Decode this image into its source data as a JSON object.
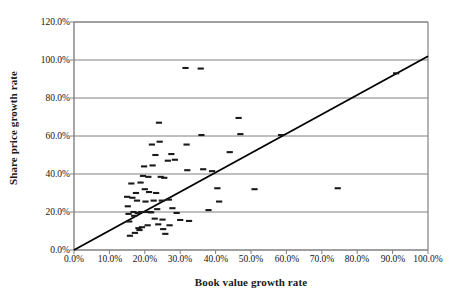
{
  "chart_data": {
    "type": "scatter",
    "title": "",
    "xlabel": "Book value growth rate",
    "ylabel": "Share price growth rate",
    "xlim": [
      0,
      100
    ],
    "ylim": [
      0,
      120
    ],
    "xticks": [
      "0.0%",
      "10.0%",
      "20.0%",
      "30.0%",
      "40.0%",
      "50.0%",
      "60.0%",
      "70.0%",
      "80.0%",
      "90.0%",
      "100.0%"
    ],
    "xtick_values": [
      0,
      10,
      20,
      30,
      40,
      50,
      60,
      70,
      80,
      90,
      100
    ],
    "yticks": [
      "0.0%",
      "20.0%",
      "40.0%",
      "60.0%",
      "80.0%",
      "100.0%",
      "120.0%"
    ],
    "ytick_values": [
      0,
      20,
      40,
      60,
      80,
      100,
      120
    ],
    "grid": "horizontal",
    "legend": "none",
    "marker": "horizontal-dash",
    "marker_color": "#1a1a1a",
    "trendline": {
      "label": "",
      "color": "#000000",
      "x_start": 0.0,
      "y_start": 0.0,
      "x_end": 100.0,
      "y_end": 102.0
    },
    "points": [
      {
        "x": 15.0,
        "y": 28.0
      },
      {
        "x": 15.2,
        "y": 23.0
      },
      {
        "x": 15.4,
        "y": 19.0
      },
      {
        "x": 15.6,
        "y": 15.0
      },
      {
        "x": 15.8,
        "y": 7.5
      },
      {
        "x": 16.2,
        "y": 35.0
      },
      {
        "x": 16.5,
        "y": 27.5
      },
      {
        "x": 16.8,
        "y": 20.0
      },
      {
        "x": 17.0,
        "y": 18.0
      },
      {
        "x": 17.2,
        "y": 9.0
      },
      {
        "x": 17.5,
        "y": 30.0
      },
      {
        "x": 17.8,
        "y": 26.0
      },
      {
        "x": 18.0,
        "y": 19.5
      },
      {
        "x": 18.2,
        "y": 11.5
      },
      {
        "x": 18.5,
        "y": 10.5
      },
      {
        "x": 18.8,
        "y": 35.5
      },
      {
        "x": 19.0,
        "y": 20.0
      },
      {
        "x": 19.2,
        "y": 12.0
      },
      {
        "x": 19.5,
        "y": 39.0
      },
      {
        "x": 19.8,
        "y": 44.0
      },
      {
        "x": 20.0,
        "y": 32.0
      },
      {
        "x": 20.2,
        "y": 25.5
      },
      {
        "x": 20.5,
        "y": 20.0
      },
      {
        "x": 20.8,
        "y": 13.0
      },
      {
        "x": 21.0,
        "y": 38.5
      },
      {
        "x": 21.2,
        "y": 30.5
      },
      {
        "x": 21.5,
        "y": 20.0
      },
      {
        "x": 21.8,
        "y": 19.8
      },
      {
        "x": 22.0,
        "y": 55.5
      },
      {
        "x": 22.2,
        "y": 44.5
      },
      {
        "x": 22.5,
        "y": 26.0
      },
      {
        "x": 22.8,
        "y": 16.5
      },
      {
        "x": 23.0,
        "y": 50.0
      },
      {
        "x": 23.2,
        "y": 30.0
      },
      {
        "x": 23.5,
        "y": 21.5
      },
      {
        "x": 23.8,
        "y": 13.5
      },
      {
        "x": 24.0,
        "y": 67.0
      },
      {
        "x": 24.2,
        "y": 57.0
      },
      {
        "x": 24.5,
        "y": 38.5
      },
      {
        "x": 24.8,
        "y": 26.0
      },
      {
        "x": 25.0,
        "y": 16.0
      },
      {
        "x": 25.2,
        "y": 11.0
      },
      {
        "x": 25.5,
        "y": 38.0
      },
      {
        "x": 25.8,
        "y": 8.5
      },
      {
        "x": 26.5,
        "y": 47.0
      },
      {
        "x": 26.8,
        "y": 26.5
      },
      {
        "x": 27.0,
        "y": 13.0
      },
      {
        "x": 27.5,
        "y": 50.5
      },
      {
        "x": 27.8,
        "y": 22.0
      },
      {
        "x": 28.5,
        "y": 47.5
      },
      {
        "x": 29.0,
        "y": 19.5
      },
      {
        "x": 30.0,
        "y": 15.8
      },
      {
        "x": 31.5,
        "y": 95.8
      },
      {
        "x": 31.8,
        "y": 55.5
      },
      {
        "x": 32.0,
        "y": 42.0
      },
      {
        "x": 32.5,
        "y": 15.3
      },
      {
        "x": 35.8,
        "y": 95.5
      },
      {
        "x": 36.0,
        "y": 60.5
      },
      {
        "x": 36.5,
        "y": 42.5
      },
      {
        "x": 38.0,
        "y": 21.0
      },
      {
        "x": 39.0,
        "y": 41.5
      },
      {
        "x": 40.5,
        "y": 32.5
      },
      {
        "x": 41.0,
        "y": 25.5
      },
      {
        "x": 44.0,
        "y": 51.5
      },
      {
        "x": 46.5,
        "y": 69.5
      },
      {
        "x": 47.0,
        "y": 61.0
      },
      {
        "x": 51.0,
        "y": 32.0
      },
      {
        "x": 58.5,
        "y": 60.5
      },
      {
        "x": 74.5,
        "y": 32.5
      },
      {
        "x": 91.0,
        "y": 93.0
      }
    ]
  },
  "plot_style": {
    "gridline_color": "#808080",
    "axis_color": "#808080",
    "plot_background": "#ffffff",
    "page_background": "#ffffff"
  }
}
